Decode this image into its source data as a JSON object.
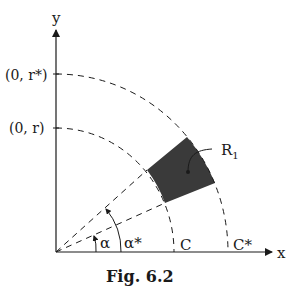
{
  "figure": {
    "caption": "Fig. 6.2",
    "axes": {
      "x_label": "x",
      "y_label": "y"
    },
    "y_ticks": [
      {
        "label": "(0, r*)"
      },
      {
        "label": "(0, r)"
      }
    ],
    "x_ticks": [
      {
        "label": "C"
      },
      {
        "label": "C*"
      }
    ],
    "angles": [
      {
        "label": "α"
      },
      {
        "label": "α*"
      }
    ],
    "region": {
      "label": "R",
      "subscript": "1",
      "fill": "#3a3a3a"
    },
    "colors": {
      "ink": "#1a1a1a",
      "region": "#3a3a3a"
    }
  }
}
